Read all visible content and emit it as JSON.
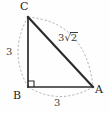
{
  "figure": {
    "type": "right-triangle-geometry-diagram",
    "background_color": "#fefefe",
    "stroke_color": "#2b2b2b",
    "arc_color": "#9a9a9a",
    "vertices": [
      {
        "name": "C",
        "label": "C",
        "x": 28,
        "y": 17,
        "role": "apex-top-left"
      },
      {
        "name": "B",
        "label": "B",
        "x": 28,
        "y": 87,
        "role": "right-angle-bottom-left"
      },
      {
        "name": "A",
        "label": "A",
        "x": 93,
        "y": 87,
        "role": "bottom-right"
      }
    ],
    "sides": [
      {
        "name": "BC",
        "label": "3",
        "from": "B",
        "to": "C",
        "arc": "left-bulge"
      },
      {
        "name": "BA",
        "label": "3",
        "from": "B",
        "to": "A",
        "arc": "down-bulge"
      },
      {
        "name": "CA",
        "label_prefix": "3",
        "label_radical": "√",
        "label_radicand": "2",
        "label": "3√2",
        "from": "C",
        "to": "A",
        "arc": "up-right-bulge"
      }
    ],
    "right_angle": {
      "at": "B",
      "marker": "square",
      "size": 6
    }
  }
}
